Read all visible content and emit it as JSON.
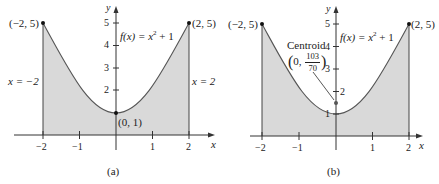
{
  "figure": {
    "function_label": "f(x) = x² + 1",
    "function_fx": "f(x)",
    "function_eq": " = x",
    "function_exp": "2",
    "function_tail": " + 1",
    "shade_color": "#d9d9d9",
    "curve_color": "#555555",
    "axis_color": "#333333"
  },
  "panel_a": {
    "caption": "(a)",
    "axis_x_label": "x",
    "axis_y_label": "y",
    "x_ticks": [
      "−2",
      "−1",
      "1",
      "2"
    ],
    "y_ticks": [
      "2",
      "3",
      "4",
      "5"
    ],
    "point_left": "(−2, 5)",
    "point_right": "(2, 5)",
    "point_vertex": "(0, 1)",
    "line_left_label": "x = −2",
    "line_right_label": "x = 2"
  },
  "panel_b": {
    "caption": "(b)",
    "axis_x_label": "x",
    "axis_y_label": "y",
    "x_ticks": [
      "−2",
      "−1",
      "1",
      "2"
    ],
    "y_ticks": [
      "1",
      "2",
      "3",
      "4",
      "5"
    ],
    "point_left": "(−2, 5)",
    "point_right": "(2, 5)",
    "centroid_title": "Centroid",
    "centroid_x": "0,",
    "centroid_num": "103",
    "centroid_den": "70"
  }
}
